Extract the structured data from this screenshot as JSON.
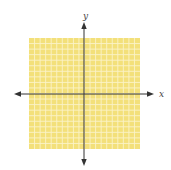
{
  "axes": {
    "x_label": "x",
    "y_label": "y"
  },
  "grid": {
    "cells_per_side": 20,
    "x_range": [
      -10,
      10
    ],
    "y_range": [
      -10,
      10
    ]
  },
  "colors": {
    "grid_fill": "#f3e07a",
    "grid_line": "#fbf3c8",
    "axis": "#333333"
  }
}
